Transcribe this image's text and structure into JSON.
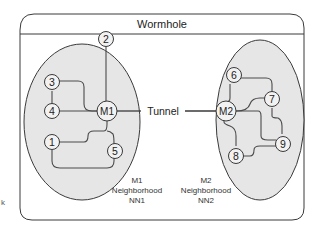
{
  "diagram": {
    "title": "Wormhole",
    "tunnel_label": "Tunnel",
    "neighborhoods": [
      {
        "id": "NN1",
        "caption_line1": "M1",
        "caption_line2": "Neighborhood",
        "caption_line3": "NN1",
        "master": "M1",
        "nodes": [
          "1",
          "2",
          "3",
          "4",
          "5"
        ]
      },
      {
        "id": "NN2",
        "caption_line1": "M2",
        "caption_line2": "Neighborhood",
        "caption_line3": "NN2",
        "master": "M2",
        "nodes": [
          "6",
          "7",
          "8",
          "9"
        ]
      }
    ],
    "node_labels": {
      "n1": "1",
      "n2": "2",
      "n3": "3",
      "n4": "4",
      "n5": "5",
      "n6": "6",
      "n7": "7",
      "n8": "8",
      "n9": "9",
      "m1": "M1",
      "m2": "M2"
    },
    "edges": [
      [
        "2",
        "M1"
      ],
      [
        "3",
        "4"
      ],
      [
        "3",
        "M1"
      ],
      [
        "4",
        "M1"
      ],
      [
        "1",
        "M1"
      ],
      [
        "1",
        "5"
      ],
      [
        "5",
        "M1"
      ],
      [
        "M1",
        "M2"
      ],
      [
        "6",
        "7"
      ],
      [
        "6",
        "M2"
      ],
      [
        "7",
        "M2"
      ],
      [
        "7",
        "9"
      ],
      [
        "M2",
        "8"
      ],
      [
        "M2",
        "9"
      ],
      [
        "8",
        "9"
      ]
    ],
    "stray_mark": "k",
    "colors": {
      "frame": "#3a3a3a",
      "neighborhood_fill": "#e6e6e6",
      "node_fill": "#f2f2f2"
    }
  }
}
